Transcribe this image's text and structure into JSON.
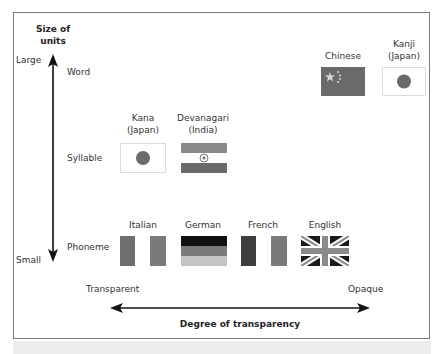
{
  "axes": {
    "y_title": "Size of units",
    "y_title_line1": "Size of",
    "y_title_line2": "units",
    "y_top_label": "Large",
    "y_bottom_label": "Small",
    "x_title": "Degree of transparency",
    "x_left_label": "Transparent",
    "x_right_label": "Opaque"
  },
  "rows": [
    {
      "label": "Word"
    },
    {
      "label": "Syllable"
    },
    {
      "label": "Phoneme"
    }
  ],
  "scripts": {
    "chinese": {
      "line1": "Chinese",
      "row": "Word",
      "flag": "china-flag"
    },
    "kanji": {
      "line1": "Kanji",
      "line2": "(Japan)",
      "row": "Word",
      "flag": "japan-flag"
    },
    "kana": {
      "line1": "Kana",
      "line2": "(Japan)",
      "row": "Syllable",
      "flag": "japan-flag"
    },
    "devanagari": {
      "line1": "Devanagari",
      "line2": "(India)",
      "row": "Syllable",
      "flag": "india-flag"
    },
    "italian": {
      "line1": "Italian",
      "row": "Phoneme",
      "flag": "italy-flag"
    },
    "german": {
      "line1": "German",
      "row": "Phoneme",
      "flag": "germany-flag"
    },
    "french": {
      "line1": "French",
      "row": "Phoneme",
      "flag": "france-flag"
    },
    "english": {
      "line1": "English",
      "row": "Phoneme",
      "flag": "uk-flag"
    }
  },
  "colors": {
    "flag_dark": "#6a6a6a",
    "flag_black": "#111111",
    "flag_mid": "#8a8a8a",
    "flag_light": "#c8c8c8",
    "arrow": "#111111",
    "border": "#7a7a7a"
  }
}
